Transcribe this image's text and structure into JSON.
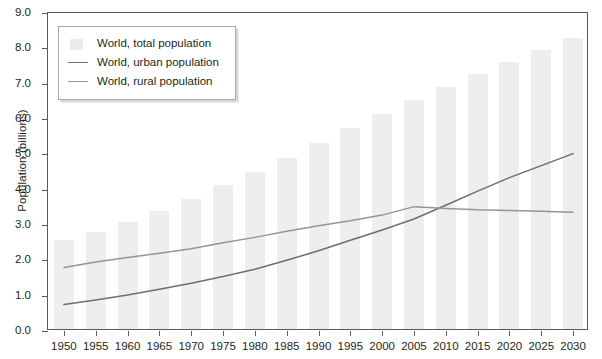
{
  "chart_data": {
    "type": "bar",
    "title": "",
    "subtitle": "",
    "xlabel": "",
    "ylabel": "Population (billions)",
    "categories": [
      "1950",
      "1955",
      "1960",
      "1965",
      "1970",
      "1975",
      "1980",
      "1985",
      "1990",
      "1995",
      "2000",
      "2005",
      "2010",
      "2015",
      "2020",
      "2025",
      "2030"
    ],
    "ylim": [
      0.0,
      9.0
    ],
    "ytick_step": 1.0,
    "ytick_labels": [
      "0.0",
      "1.0",
      "2.0",
      "3.0",
      "4.0",
      "5.0",
      "6.0",
      "7.0",
      "8.0",
      "9.0"
    ],
    "grid": false,
    "legend_position": "top-left",
    "series": [
      {
        "name": "World, total population",
        "type": "bar",
        "color": "#eeeeee",
        "values": [
          2.52,
          2.75,
          3.02,
          3.33,
          3.69,
          4.07,
          4.43,
          4.83,
          5.27,
          5.68,
          6.09,
          6.49,
          6.86,
          7.23,
          7.56,
          7.9,
          8.25
        ]
      },
      {
        "name": "World, urban population",
        "type": "line",
        "color": "#6d6e71",
        "values": [
          0.75,
          0.88,
          1.02,
          1.18,
          1.35,
          1.54,
          1.75,
          2.0,
          2.27,
          2.57,
          2.86,
          3.17,
          3.56,
          3.96,
          4.34,
          4.68,
          5.02
        ]
      },
      {
        "name": "World, rural population",
        "type": "line",
        "color": "#939598",
        "values": [
          1.8,
          1.95,
          2.08,
          2.2,
          2.33,
          2.5,
          2.65,
          2.82,
          2.98,
          3.12,
          3.28,
          3.52,
          3.47,
          3.43,
          3.41,
          3.39,
          3.36
        ]
      }
    ]
  },
  "legend": {
    "items": [
      {
        "label": "World, total population",
        "key": "swatch-total"
      },
      {
        "label": "World, urban population",
        "key": "swatch-urban"
      },
      {
        "label": "World, rural population",
        "key": "swatch-rural"
      }
    ]
  },
  "colors": {
    "bar": "#eeeeee",
    "urban_line": "#6d6e71",
    "rural_line": "#939598",
    "axis": "#58595b",
    "text": "#231f20",
    "legend_border": "#a7a9ac"
  }
}
